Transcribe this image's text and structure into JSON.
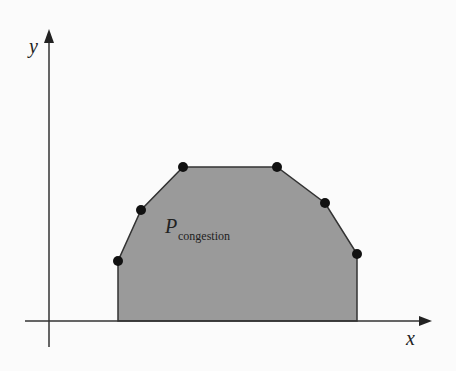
{
  "diagram": {
    "axes": {
      "x_label": "x",
      "y_label": "y"
    },
    "region": {
      "label_main": "P",
      "label_sub": "congestion",
      "fill_color": "#999999",
      "stroke_color": "#333333",
      "vertices": [
        [
          118,
          321
        ],
        [
          118,
          261
        ],
        [
          141,
          210
        ],
        [
          183,
          167
        ],
        [
          277,
          167
        ],
        [
          325,
          203
        ],
        [
          357,
          254
        ],
        [
          357,
          321
        ]
      ]
    },
    "points": [
      [
        118,
        261
      ],
      [
        141,
        210
      ],
      [
        183,
        167
      ],
      [
        277,
        167
      ],
      [
        325,
        203
      ],
      [
        357,
        254
      ]
    ]
  }
}
